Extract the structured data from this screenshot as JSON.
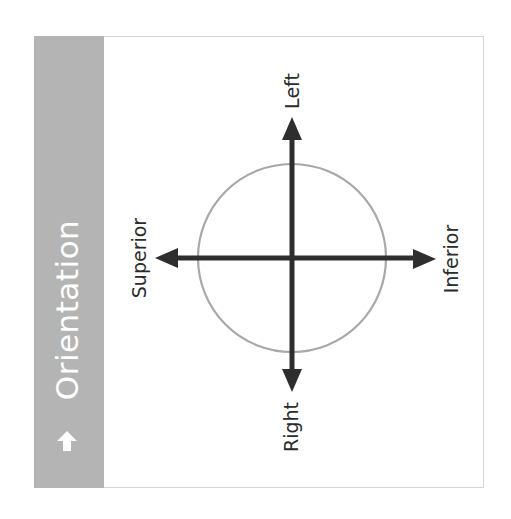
{
  "sidebar": {
    "title": "Orientation",
    "icon": "arrow-up-icon",
    "background_color": "#b4b4b4",
    "text_color": "#ffffff"
  },
  "diagram": {
    "circle_color": "#a8a8a8",
    "axis_color": "#2e2e2e",
    "labels": {
      "top": "Left",
      "bottom": "Right",
      "left": "Superior",
      "right": "Inferior"
    }
  }
}
